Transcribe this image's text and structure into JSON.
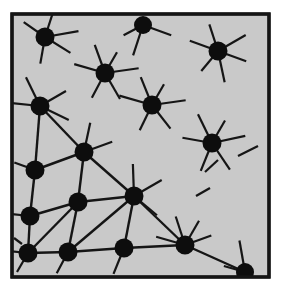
{
  "figure": {
    "canvas": {
      "width": 285,
      "height": 304
    },
    "frame": {
      "x": 12,
      "y": 14,
      "width": 257,
      "height": 263,
      "background_color": "#c9c9c9",
      "border_color": "#141414",
      "border_width": 3.2
    },
    "style": {
      "node_color": "#0d0d0d",
      "edge_color": "#151515",
      "page_background": "#ffffff",
      "node_radius": 8.5,
      "edge_width": 2.4,
      "spoke_width": 2.2
    }
  },
  "chart_data": {
    "type": "scatter",
    "xlabel": "",
    "ylabel": "",
    "xlim": [
      12,
      269
    ],
    "ylim": [
      14,
      277
    ],
    "grid": false,
    "legend": null,
    "node_count": 16,
    "edge_count": 22,
    "nodes": [
      {
        "id": "n1",
        "x": 45,
        "y": 37,
        "r": 9.5,
        "degree": 5
      },
      {
        "id": "n2",
        "x": 143,
        "y": 25,
        "r": 9.0,
        "degree": 3
      },
      {
        "id": "n3",
        "x": 218,
        "y": 51,
        "r": 9.5,
        "degree": 6
      },
      {
        "id": "n4",
        "x": 105,
        "y": 73,
        "r": 9.5,
        "degree": 6
      },
      {
        "id": "n5",
        "x": 40,
        "y": 106,
        "r": 9.5,
        "degree": 6
      },
      {
        "id": "n6",
        "x": 152,
        "y": 105,
        "r": 9.5,
        "degree": 6
      },
      {
        "id": "n7",
        "x": 212,
        "y": 143,
        "r": 9.5,
        "degree": 6
      },
      {
        "id": "n8",
        "x": 84,
        "y": 152,
        "r": 9.5,
        "degree": 6
      },
      {
        "id": "n9",
        "x": 35,
        "y": 170,
        "r": 9.5,
        "degree": 5
      },
      {
        "id": "n10",
        "x": 134,
        "y": 196,
        "r": 9.5,
        "degree": 6
      },
      {
        "id": "n11",
        "x": 78,
        "y": 202,
        "r": 9.5,
        "degree": 6
      },
      {
        "id": "n12",
        "x": 30,
        "y": 216,
        "r": 9.5,
        "degree": 5
      },
      {
        "id": "n13",
        "x": 28,
        "y": 253,
        "r": 9.5,
        "degree": 5
      },
      {
        "id": "n14",
        "x": 68,
        "y": 252,
        "r": 9.5,
        "degree": 6
      },
      {
        "id": "n15",
        "x": 124,
        "y": 248,
        "r": 9.5,
        "degree": 6
      },
      {
        "id": "n16",
        "x": 185,
        "y": 245,
        "r": 9.5,
        "degree": 6
      },
      {
        "id": "n17",
        "x": 245,
        "y": 272,
        "r": 9.0,
        "degree": 3
      }
    ],
    "edges": [
      {
        "from": "n5",
        "to": "n9"
      },
      {
        "from": "n5",
        "to": "n8"
      },
      {
        "from": "n9",
        "to": "n8"
      },
      {
        "from": "n9",
        "to": "n12"
      },
      {
        "from": "n12",
        "to": "n13"
      },
      {
        "from": "n12",
        "to": "n11"
      },
      {
        "from": "n8",
        "to": "n11"
      },
      {
        "from": "n8",
        "to": "n10"
      },
      {
        "from": "n11",
        "to": "n13"
      },
      {
        "from": "n11",
        "to": "n14"
      },
      {
        "from": "n11",
        "to": "n10"
      },
      {
        "from": "n13",
        "to": "n14"
      },
      {
        "from": "n14",
        "to": "n15"
      },
      {
        "from": "n14",
        "to": "n10"
      },
      {
        "from": "n10",
        "to": "n15"
      },
      {
        "from": "n10",
        "to": "n16"
      },
      {
        "from": "n15",
        "to": "n16"
      },
      {
        "from": "n16",
        "to": "n17"
      }
    ],
    "dangling_spokes": [
      {
        "node": "n1",
        "angle_deg": 215,
        "length": 26
      },
      {
        "node": "n1",
        "angle_deg": 288,
        "length": 26
      },
      {
        "node": "n1",
        "angle_deg": 350,
        "length": 34
      },
      {
        "node": "n1",
        "angle_deg": 32,
        "length": 30
      },
      {
        "node": "n1",
        "angle_deg": 100,
        "length": 27
      },
      {
        "node": "n2",
        "angle_deg": 20,
        "length": 30
      },
      {
        "node": "n2",
        "angle_deg": 108,
        "length": 32
      },
      {
        "node": "n2",
        "angle_deg": 152,
        "length": 22
      },
      {
        "node": "n3",
        "angle_deg": 200,
        "length": 30
      },
      {
        "node": "n3",
        "angle_deg": 252,
        "length": 28
      },
      {
        "node": "n3",
        "angle_deg": 330,
        "length": 32
      },
      {
        "node": "n3",
        "angle_deg": 20,
        "length": 30
      },
      {
        "node": "n3",
        "angle_deg": 78,
        "length": 32
      },
      {
        "node": "n3",
        "angle_deg": 130,
        "length": 26
      },
      {
        "node": "n4",
        "angle_deg": 196,
        "length": 32
      },
      {
        "node": "n4",
        "angle_deg": 250,
        "length": 30
      },
      {
        "node": "n4",
        "angle_deg": 300,
        "length": 24
      },
      {
        "node": "n4",
        "angle_deg": 352,
        "length": 34
      },
      {
        "node": "n4",
        "angle_deg": 60,
        "length": 30
      },
      {
        "node": "n4",
        "angle_deg": 118,
        "length": 28
      },
      {
        "node": "n5",
        "angle_deg": 186,
        "length": 30
      },
      {
        "node": "n5",
        "angle_deg": 244,
        "length": 32
      },
      {
        "node": "n5",
        "angle_deg": 330,
        "length": 30
      },
      {
        "node": "n5",
        "angle_deg": 26,
        "length": 32
      },
      {
        "node": "n6",
        "angle_deg": 196,
        "length": 34
      },
      {
        "node": "n6",
        "angle_deg": 248,
        "length": 30
      },
      {
        "node": "n6",
        "angle_deg": 300,
        "length": 24
      },
      {
        "node": "n6",
        "angle_deg": 352,
        "length": 34
      },
      {
        "node": "n6",
        "angle_deg": 52,
        "length": 30
      },
      {
        "node": "n6",
        "angle_deg": 116,
        "length": 28
      },
      {
        "node": "n7",
        "angle_deg": 190,
        "length": 30
      },
      {
        "node": "n7",
        "angle_deg": 244,
        "length": 32
      },
      {
        "node": "n7",
        "angle_deg": 300,
        "length": 26
      },
      {
        "node": "n7",
        "angle_deg": 348,
        "length": 34
      },
      {
        "node": "n7",
        "angle_deg": 56,
        "length": 32
      },
      {
        "node": "n7",
        "angle_deg": 112,
        "length": 30
      },
      {
        "node": "n8",
        "angle_deg": 282,
        "length": 30
      },
      {
        "node": "n8",
        "angle_deg": 340,
        "length": 30
      },
      {
        "node": "n9",
        "angle_deg": 200,
        "length": 22
      },
      {
        "node": "n10",
        "angle_deg": 268,
        "length": 32
      },
      {
        "node": "n10",
        "angle_deg": 330,
        "length": 32
      },
      {
        "node": "n10",
        "angle_deg": 40,
        "length": 30
      },
      {
        "node": "n12",
        "angle_deg": 186,
        "length": 20
      },
      {
        "node": "n13",
        "angle_deg": 186,
        "length": 18
      },
      {
        "node": "n13",
        "angle_deg": 120,
        "length": 22
      },
      {
        "node": "n14",
        "angle_deg": 118,
        "length": 24
      },
      {
        "node": "n15",
        "angle_deg": 112,
        "length": 28
      },
      {
        "node": "n16",
        "angle_deg": 196,
        "length": 30
      },
      {
        "node": "n16",
        "angle_deg": 252,
        "length": 30
      },
      {
        "node": "n16",
        "angle_deg": 300,
        "length": 28
      },
      {
        "node": "n16",
        "angle_deg": 340,
        "length": 28
      },
      {
        "node": "n17",
        "angle_deg": 260,
        "length": 32
      },
      {
        "node": "n17",
        "angle_deg": 196,
        "length": 22
      }
    ],
    "stray_segments": [
      {
        "x1": 238,
        "y1": 156,
        "x2": 258,
        "y2": 146
      },
      {
        "x1": 205,
        "y1": 172,
        "x2": 218,
        "y2": 160
      },
      {
        "x1": 196,
        "y1": 196,
        "x2": 210,
        "y2": 188
      },
      {
        "x1": 14,
        "y1": 238,
        "x2": 22,
        "y2": 244
      }
    ]
  }
}
